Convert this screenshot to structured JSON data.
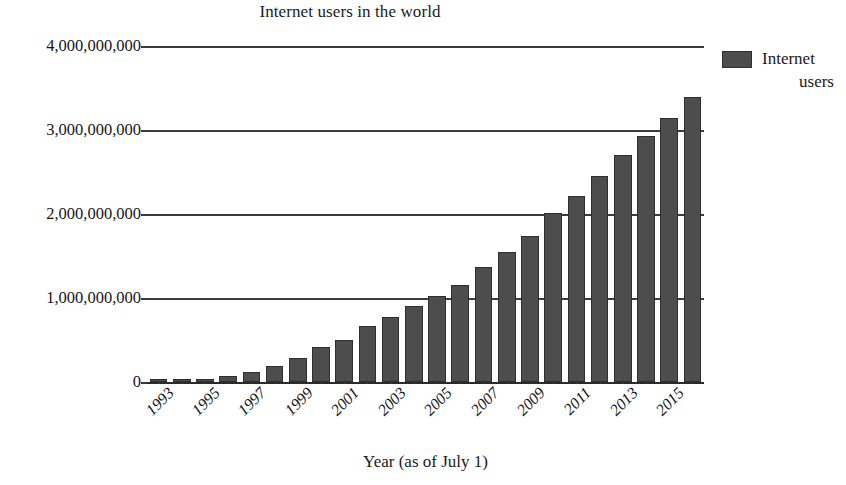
{
  "chart_data": {
    "type": "bar",
    "title": "Internet users in the world",
    "xlabel": "Year (as of July 1)",
    "ylabel": "",
    "ylim": [
      0,
      4000000000
    ],
    "grid": true,
    "legend_position": "right",
    "legend": [
      "Internet users"
    ],
    "ytick_labels": [
      "0",
      "1,000,000,000",
      "2,000,000,000",
      "3,000,000,000",
      "4,000,000,000"
    ],
    "ytick_values": [
      0,
      1000000000,
      2000000000,
      3000000000,
      4000000000
    ],
    "xtick_labels": [
      "1993",
      "1995",
      "1997",
      "1999",
      "2001",
      "2003",
      "2005",
      "2007",
      "2009",
      "2011",
      "2013",
      "2015"
    ],
    "categories": [
      "1993",
      "1994",
      "1995",
      "1996",
      "1997",
      "1998",
      "1999",
      "2000",
      "2001",
      "2002",
      "2003",
      "2004",
      "2005",
      "2006",
      "2007",
      "2008",
      "2009",
      "2010",
      "2011",
      "2012",
      "2013",
      "2014",
      "2015",
      "2016"
    ],
    "values": [
      14000000,
      25000000,
      40000000,
      77000000,
      120000000,
      188000000,
      280000000,
      414000000,
      500000000,
      665000000,
      778000000,
      910000000,
      1024000000,
      1151000000,
      1365000000,
      1546000000,
      1734000000,
      2010000000,
      2216000000,
      2449000000,
      2698000000,
      2925000000,
      3148000000,
      3390000000
    ],
    "series": [
      {
        "name": "Internet users",
        "color": "#4d4d4d",
        "values": [
          14000000,
          25000000,
          40000000,
          77000000,
          120000000,
          188000000,
          280000000,
          414000000,
          500000000,
          665000000,
          778000000,
          910000000,
          1024000000,
          1151000000,
          1365000000,
          1546000000,
          1734000000,
          2010000000,
          2216000000,
          2449000000,
          2698000000,
          2925000000,
          3148000000,
          3390000000
        ]
      }
    ]
  },
  "legend": {
    "entry_label_line1": "Internet",
    "entry_label_line2": "users",
    "swatch_color": "#4d4d4d"
  },
  "colors": {
    "bar_fill": "#4d4d4d",
    "bar_edge": "#2f2f2f",
    "gridline": "#3b3b3b",
    "text": "#1a1a1a",
    "background": "#ffffff"
  }
}
